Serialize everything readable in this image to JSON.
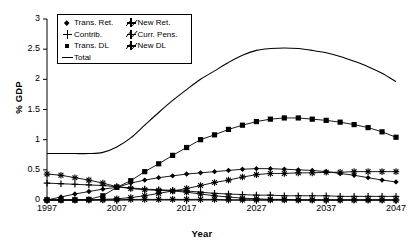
{
  "chart_data": {
    "type": "line",
    "title": "",
    "xlabel": "Year",
    "ylabel": "% GDP",
    "xlim": [
      1997,
      2047
    ],
    "ylim": [
      0,
      3
    ],
    "yticks": [
      0,
      0.5,
      1,
      1.5,
      2,
      2.5,
      3
    ],
    "ytick_labels": [
      "0",
      "0.5",
      "1",
      "1.5",
      "2",
      "2.5",
      "3"
    ],
    "xticks": [
      1997,
      2007,
      2017,
      2027,
      2037,
      2047
    ],
    "xtick_labels": [
      "1997",
      "2007",
      "2017",
      "2027",
      "2037",
      "2047"
    ],
    "grid": false,
    "legend_position": "top-left-inside",
    "x": [
      1997,
      1999,
      2001,
      2003,
      2005,
      2007,
      2009,
      2011,
      2013,
      2015,
      2017,
      2019,
      2021,
      2023,
      2025,
      2027,
      2029,
      2031,
      2033,
      2035,
      2037,
      2039,
      2041,
      2043,
      2045,
      2047
    ],
    "series": [
      {
        "name": "Trans. Ret.",
        "marker": "diamond",
        "values": [
          0.0,
          0.05,
          0.1,
          0.14,
          0.18,
          0.21,
          0.28,
          0.33,
          0.37,
          0.4,
          0.43,
          0.45,
          0.47,
          0.49,
          0.51,
          0.52,
          0.52,
          0.51,
          0.5,
          0.49,
          0.47,
          0.44,
          0.41,
          0.37,
          0.33,
          0.3
        ]
      },
      {
        "name": "New Ret.",
        "marker": "star",
        "values": [
          0.0,
          0.0,
          0.0,
          0.0,
          0.01,
          0.02,
          0.04,
          0.07,
          0.11,
          0.15,
          0.19,
          0.24,
          0.29,
          0.33,
          0.38,
          0.42,
          0.44,
          0.44,
          0.45,
          0.45,
          0.46,
          0.46,
          0.47,
          0.47,
          0.47,
          0.47
        ]
      },
      {
        "name": "Contrib.",
        "marker": "plus",
        "values": [
          0.28,
          0.27,
          0.26,
          0.25,
          0.24,
          0.22,
          0.2,
          0.18,
          0.17,
          0.16,
          0.15,
          0.13,
          0.11,
          0.1,
          0.09,
          0.08,
          0.08,
          0.07,
          0.07,
          0.07,
          0.07,
          0.06,
          0.06,
          0.06,
          0.06,
          0.06
        ]
      },
      {
        "name": "Curr. Pens.",
        "marker": "star",
        "values": [
          0.43,
          0.41,
          0.37,
          0.33,
          0.28,
          0.22,
          0.19,
          0.17,
          0.16,
          0.15,
          0.13,
          0.1,
          0.07,
          0.05,
          0.03,
          0.02,
          0.01,
          0.01,
          0.0,
          0.0,
          0.0,
          0.0,
          0.0,
          0.0,
          0.0,
          0.0
        ]
      },
      {
        "name": "Trans. DL",
        "marker": "square",
        "values": [
          0.0,
          0.0,
          0.0,
          0.01,
          0.07,
          0.21,
          0.32,
          0.47,
          0.6,
          0.74,
          0.87,
          1.0,
          1.08,
          1.17,
          1.24,
          1.3,
          1.34,
          1.36,
          1.36,
          1.34,
          1.32,
          1.29,
          1.25,
          1.2,
          1.13,
          1.04
        ]
      },
      {
        "name": "New  DL",
        "marker": "star",
        "values": [
          0.0,
          0.0,
          0.0,
          0.0,
          0.0,
          0.0,
          0.01,
          0.01,
          0.01,
          0.01,
          0.01,
          0.01,
          0.01,
          0.0,
          0.0,
          0.0,
          0.0,
          0.0,
          0.0,
          0.0,
          0.0,
          0.0,
          0.0,
          0.0,
          0.0,
          0.0
        ]
      },
      {
        "name": "Total",
        "marker": "none",
        "values": [
          0.77,
          0.77,
          0.77,
          0.77,
          0.79,
          0.88,
          1.03,
          1.24,
          1.45,
          1.65,
          1.83,
          2.0,
          2.14,
          2.28,
          2.4,
          2.48,
          2.51,
          2.52,
          2.51,
          2.48,
          2.44,
          2.38,
          2.3,
          2.21,
          2.1,
          1.96
        ]
      }
    ],
    "legend": [
      {
        "label": "Trans. Ret.",
        "marker": "diamond"
      },
      {
        "label": "New Ret.",
        "marker": "star"
      },
      {
        "label": "Contrib.",
        "marker": "plus"
      },
      {
        "label": "Curr. Pens.",
        "marker": "star"
      },
      {
        "label": "Trans. DL",
        "marker": "square"
      },
      {
        "label": "New  DL",
        "marker": "star"
      },
      {
        "label": "Total",
        "marker": "line"
      }
    ],
    "colors": {
      "series": "#000000",
      "axis": "#000000",
      "background": "#ffffff"
    }
  }
}
